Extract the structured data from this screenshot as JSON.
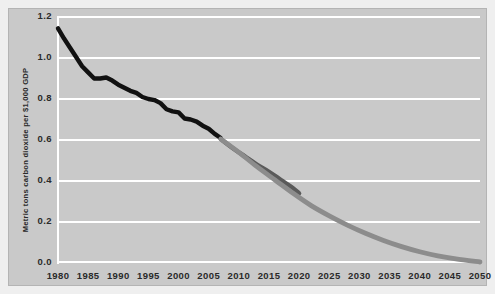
{
  "chart_data": {
    "type": "line",
    "title": "",
    "subtitle": "",
    "xlabel": "",
    "ylabel": "Metric tons carbon dioxide per $1,000 GDP",
    "xlim": [
      1980,
      2050
    ],
    "ylim": [
      0.0,
      1.2
    ],
    "grid": true,
    "grid_axis": "y",
    "legend": "none",
    "xticks": [
      1980,
      1985,
      1990,
      1995,
      2000,
      2005,
      2010,
      2015,
      2020,
      2025,
      2030,
      2035,
      2040,
      2045,
      2050
    ],
    "xtick_labels": [
      "1980",
      "1985",
      "1990",
      "1995",
      "2000",
      "2005",
      "2010",
      "2015",
      "2020",
      "2025",
      "2030",
      "2035",
      "2040",
      "2045",
      "2050"
    ],
    "yticks": [
      0.0,
      0.2,
      0.4,
      0.6,
      0.8,
      1.0,
      1.2
    ],
    "ytick_labels": [
      "0.0",
      "0.2",
      "0.4",
      "0.6",
      "0.8",
      "1.0",
      "1.2"
    ],
    "colors": {
      "plot_background": "#c9c9c9",
      "figure_background": "#efefef",
      "gridline": "#ffffff",
      "historical_line": "#111111",
      "projection_steep_line": "#5a5a5a",
      "projection_long_line": "#8c8c8c",
      "tick_text": "#2a2a2a",
      "figure_border": "#b4b4b4"
    },
    "series": [
      {
        "name": "Historical carbon intensity",
        "color": "#111111",
        "width": 4.4,
        "x": [
          1980,
          1981,
          1982,
          1983,
          1984,
          1985,
          1986,
          1987,
          1988,
          1989,
          1990,
          1991,
          1992,
          1993,
          1994,
          1995,
          1996,
          1997,
          1998,
          1999,
          2000,
          2001,
          2002,
          2003,
          2004,
          2005,
          2006,
          2007
        ],
        "values": [
          1.14,
          1.09,
          1.045,
          1.0,
          0.955,
          0.925,
          0.895,
          0.895,
          0.9,
          0.885,
          0.865,
          0.85,
          0.835,
          0.825,
          0.805,
          0.795,
          0.79,
          0.775,
          0.745,
          0.735,
          0.73,
          0.7,
          0.695,
          0.685,
          0.665,
          0.65,
          0.625,
          0.605
        ]
      },
      {
        "name": "Near-term projection",
        "color": "#5a5a5a",
        "width": 4.4,
        "x": [
          2007,
          2009,
          2011,
          2013,
          2015,
          2017,
          2019,
          2020
        ],
        "values": [
          0.6,
          0.555,
          0.515,
          0.475,
          0.44,
          0.4,
          0.36,
          0.335
        ]
      },
      {
        "name": "Long-term projection to 2050",
        "color": "#8c8c8c",
        "width": 4.8,
        "x": [
          2007,
          2010,
          2013,
          2016,
          2019,
          2022,
          2025,
          2028,
          2031,
          2034,
          2037,
          2040,
          2043,
          2046,
          2050
        ],
        "values": [
          0.6,
          0.535,
          0.465,
          0.4,
          0.335,
          0.275,
          0.225,
          0.18,
          0.14,
          0.105,
          0.075,
          0.05,
          0.03,
          0.015,
          0.0
        ]
      }
    ]
  }
}
